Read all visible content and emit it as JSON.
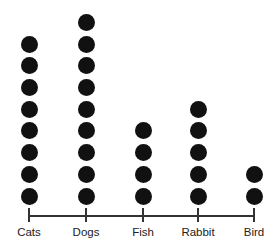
{
  "chart_data": {
    "type": "dot",
    "title": "",
    "xlabel": "",
    "ylabel": "",
    "categories": [
      "Cats",
      "Dogs",
      "Fish",
      "Rabbit",
      "Bird"
    ],
    "values": [
      8,
      9,
      4,
      5,
      2
    ],
    "grid": false,
    "legend": null,
    "marker_color": "#111111"
  },
  "layout": {
    "x_positions": [
      29,
      86,
      143,
      198,
      254
    ],
    "baseline_y": 196,
    "spacing": 21.7
  }
}
